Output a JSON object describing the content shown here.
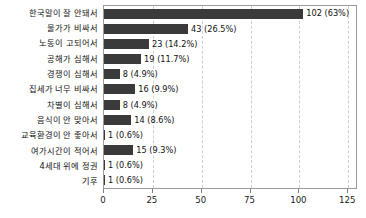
{
  "chart_data": {
    "type": "bar",
    "orientation": "horizontal",
    "title": "",
    "subtitle": "",
    "xlabel": "",
    "ylabel": "",
    "xlim": [
      0,
      130
    ],
    "ylim": null,
    "grid": true,
    "grid_axis": "x",
    "legend": null,
    "legend_position": "none",
    "bar_color": "#3a3a3a",
    "axis_color": "#9a9a9a",
    "gridline_color": "#cfcfcf",
    "xticks": [
      0,
      25,
      50,
      75,
      100,
      125
    ],
    "xtick_labels": [
      "0",
      "25",
      "50",
      "75",
      "100",
      "125"
    ],
    "categories": [
      "한국말이 잘 안돼서",
      "물가가 비싸서",
      "노동이 고되어서",
      "공해가 심해서",
      "경쟁이 심해서",
      "집세가 너무 비싸서",
      "차별이 심해서",
      "음식이 안 맞아서",
      "교육환경이 안 좋아서",
      "여가시간이 적어서",
      "4세대 위에 정권",
      "기후"
    ],
    "values": [
      102,
      43,
      23,
      19,
      8,
      16,
      8,
      14,
      1,
      15,
      1,
      1
    ],
    "percents": [
      "63%",
      "26.5%",
      "14.2%",
      "11.7%",
      "4.9%",
      "9.9%",
      "4.9%",
      "8.6%",
      "0.6%",
      "9.3%",
      "0.6%",
      "0.6%"
    ],
    "data_labels": [
      "102 (63%)",
      "43 (26.5%)",
      "23 (14.2%)",
      "19 (11.7%)",
      "8 (4.9%)",
      "16 (9.9%)",
      "8 (4.9%)",
      "14 (8.6%)",
      "1 (0.6%)",
      "15 (9.3%)",
      "1 (0.6%)",
      "1 (0.6%)"
    ]
  }
}
